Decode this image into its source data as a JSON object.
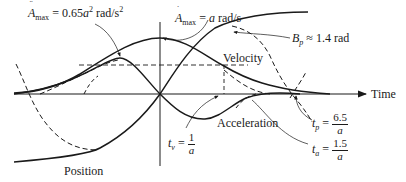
{
  "diagram": {
    "type": "motion-profile",
    "axis": {
      "time_label": "Time"
    },
    "curves": [
      {
        "name": "Position",
        "label": "Position"
      },
      {
        "name": "Velocity",
        "label": "Velocity"
      },
      {
        "name": "Acceleration",
        "label": "Acceleration"
      }
    ],
    "annotations": {
      "accel_max": {
        "symbol": "A",
        "dots": "¨",
        "sub": "max",
        "value": "= 0.65",
        "var": "a",
        "exp": "2",
        "unit": "rad/s",
        "unit_exp": "2"
      },
      "vel_max": {
        "symbol": "A",
        "dots": "˙",
        "sub": "max",
        "value": "= ",
        "var": "a",
        "unit": " rad/s"
      },
      "bp": {
        "symbol": "B",
        "sub": "p",
        "value": "≈ 1.4 rad"
      },
      "tv": {
        "symbol": "t",
        "sub": "v",
        "eq": "=",
        "num": "1",
        "den": "a"
      },
      "tp": {
        "symbol": "t",
        "sub": "p",
        "eq": "=",
        "num": "6.5",
        "den": "a"
      },
      "ta": {
        "symbol": "t",
        "sub": "a",
        "eq": "=",
        "num": "1.5",
        "den": "a"
      }
    },
    "colors": {
      "ink": "#1a1a1a",
      "background": "#ffffff"
    }
  }
}
